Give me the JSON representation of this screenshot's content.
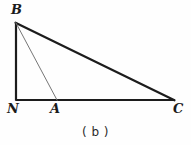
{
  "figure": {
    "caption": "( b )",
    "background_color": "#fefefe",
    "width": 191,
    "height": 145,
    "vertex_labels": {
      "B": "B",
      "N": "N",
      "A": "A",
      "C": "C"
    },
    "stroke_colors": {
      "thick": "#1c1c1c",
      "thin": "#767676"
    },
    "stroke_widths": {
      "thick": 2.2,
      "thin": 1
    }
  },
  "chart_data": {
    "type": "diagram",
    "title": "( b )",
    "points": [
      {
        "name": "B",
        "x": 16,
        "y": 23,
        "label": "B",
        "label_pos": "above-left"
      },
      {
        "name": "N",
        "x": 16,
        "y": 100,
        "label": "N",
        "label_pos": "below-left"
      },
      {
        "name": "A",
        "x": 57,
        "y": 100,
        "label": "A",
        "label_pos": "below"
      },
      {
        "name": "C",
        "x": 174,
        "y": 100,
        "label": "C",
        "label_pos": "below-right"
      }
    ],
    "segments": [
      {
        "name": "BN",
        "from": "B",
        "to": "N",
        "style": "thick",
        "color": "#1c1c1c",
        "width": 2.2
      },
      {
        "name": "NC",
        "from": "N",
        "to": "C",
        "style": "thick",
        "color": "#1c1c1c",
        "width": 2.2
      },
      {
        "name": "BC",
        "from": "B",
        "to": "C",
        "style": "thick",
        "color": "#1c1c1c",
        "width": 2.2
      },
      {
        "name": "BA",
        "from": "B",
        "to": "A",
        "style": "thin",
        "color": "#767676",
        "width": 1
      }
    ],
    "xlabel": "",
    "ylabel": "",
    "grid": false,
    "legend": "none"
  }
}
